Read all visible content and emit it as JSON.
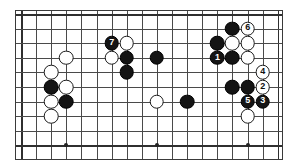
{
  "figure": {
    "kind": "go-board-diagram",
    "background_color": "#ffffff",
    "board": {
      "columns": 18,
      "rows": 10,
      "line_color": "#4a4a4a",
      "border_color": "#2f2f2f",
      "left": 15,
      "top": 10,
      "width": 268,
      "height": 150,
      "cell_width": 15.1,
      "cell_height": 14.6,
      "origin_x": 6,
      "origin_y": 4
    },
    "star_points": [
      {
        "col": 3,
        "row": 9
      },
      {
        "col": 9,
        "row": 9
      },
      {
        "col": 15,
        "row": 9
      }
    ],
    "colors": {
      "black_stone": "#141414",
      "white_stone": "#ffffff",
      "stone_outline": "#1c1c1c",
      "black_label": "#ffffff",
      "white_label": "#101010"
    },
    "stones": [
      {
        "id": "w-a",
        "color": "white",
        "col": 3,
        "row": 3,
        "label": ""
      },
      {
        "id": "w-b",
        "color": "white",
        "col": 2,
        "row": 4,
        "label": ""
      },
      {
        "id": "b-a",
        "color": "black",
        "col": 2,
        "row": 5,
        "label": ""
      },
      {
        "id": "w-c",
        "color": "white",
        "col": 3,
        "row": 5,
        "label": ""
      },
      {
        "id": "w-d",
        "color": "white",
        "col": 2,
        "row": 6,
        "label": ""
      },
      {
        "id": "b-b",
        "color": "black",
        "col": 3,
        "row": 6,
        "label": ""
      },
      {
        "id": "w-e",
        "color": "white",
        "col": 2,
        "row": 7,
        "label": ""
      },
      {
        "id": "m7",
        "color": "black",
        "col": 6,
        "row": 2,
        "label": "7"
      },
      {
        "id": "w-f",
        "color": "white",
        "col": 7,
        "row": 2,
        "label": ""
      },
      {
        "id": "w-g",
        "color": "white",
        "col": 6,
        "row": 3,
        "label": ""
      },
      {
        "id": "b-c",
        "color": "black",
        "col": 7,
        "row": 3,
        "label": ""
      },
      {
        "id": "b-d",
        "color": "black",
        "col": 7,
        "row": 4,
        "label": ""
      },
      {
        "id": "b-e",
        "color": "black",
        "col": 9,
        "row": 3,
        "label": ""
      },
      {
        "id": "w-h",
        "color": "white",
        "col": 9,
        "row": 6,
        "label": ""
      },
      {
        "id": "b-f",
        "color": "black",
        "col": 11,
        "row": 6,
        "label": ""
      },
      {
        "id": "b-g",
        "color": "black",
        "col": 14,
        "row": 1,
        "label": ""
      },
      {
        "id": "m6",
        "color": "white",
        "col": 15,
        "row": 1,
        "label": "6"
      },
      {
        "id": "b-h",
        "color": "black",
        "col": 13,
        "row": 2,
        "label": ""
      },
      {
        "id": "w-i",
        "color": "white",
        "col": 14,
        "row": 2,
        "label": ""
      },
      {
        "id": "w-j",
        "color": "white",
        "col": 15,
        "row": 2,
        "label": ""
      },
      {
        "id": "m1",
        "color": "black",
        "col": 13,
        "row": 3,
        "label": "1"
      },
      {
        "id": "b-i",
        "color": "black",
        "col": 14,
        "row": 3,
        "label": ""
      },
      {
        "id": "w-k",
        "color": "white",
        "col": 15,
        "row": 3,
        "label": ""
      },
      {
        "id": "m4",
        "color": "white",
        "col": 16,
        "row": 4,
        "label": "4"
      },
      {
        "id": "b-j",
        "color": "black",
        "col": 14,
        "row": 5,
        "label": ""
      },
      {
        "id": "b-k",
        "color": "black",
        "col": 15,
        "row": 5,
        "label": ""
      },
      {
        "id": "m2",
        "color": "white",
        "col": 16,
        "row": 5,
        "label": "2"
      },
      {
        "id": "m5",
        "color": "black",
        "col": 15,
        "row": 6,
        "label": "5"
      },
      {
        "id": "m3",
        "color": "black",
        "col": 16,
        "row": 6,
        "label": "3"
      },
      {
        "id": "w-l",
        "color": "white",
        "col": 15,
        "row": 7,
        "label": ""
      }
    ]
  }
}
